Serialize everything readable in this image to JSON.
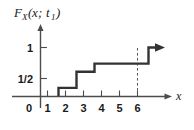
{
  "chart_data": {
    "type": "line",
    "title": "",
    "ylabel": "F_X(x; t_1)",
    "xlabel": "x",
    "step_style": "right-continuous staircase (CDF)",
    "x": [
      1,
      2,
      3,
      6
    ],
    "values": [
      0.1667,
      0.5,
      0.6667,
      1.0
    ],
    "xlim": [
      0,
      7
    ],
    "ylim": [
      0,
      1.15
    ],
    "xticks": [
      1,
      2,
      3,
      4,
      5,
      6
    ],
    "xtick_labels": [
      "1",
      "2",
      "3",
      "4",
      "5",
      "6"
    ],
    "yticks": [
      0.5,
      1
    ],
    "ytick_labels": [
      "1/2",
      "1"
    ],
    "origin_label": "0",
    "grid": false,
    "legend": null,
    "annotations": [
      "dashed vertical drop line at x = 6",
      "arrow continuing right at y = 1"
    ],
    "colors": {
      "curve": "#333333",
      "axis": "#4d4d4d",
      "text": "#1a1a1a",
      "background": "#ffffff"
    }
  },
  "labels": {
    "y_axis_caption": {
      "symbol": "F",
      "subscript": "X",
      "argument_open": "(",
      "variable": "x",
      "separator": "; ",
      "param": "t",
      "param_subscript": "1",
      "argument_close": ")",
      "full": "F_X(x; t_1)"
    },
    "x_axis_caption": "x",
    "origin": "0",
    "y_tick_one": "1",
    "y_tick_half": "1/2",
    "x_tick_1": "1",
    "x_tick_2": "2",
    "x_tick_3": "3",
    "x_tick_4": "4",
    "x_tick_5": "5",
    "x_tick_6": "6"
  }
}
